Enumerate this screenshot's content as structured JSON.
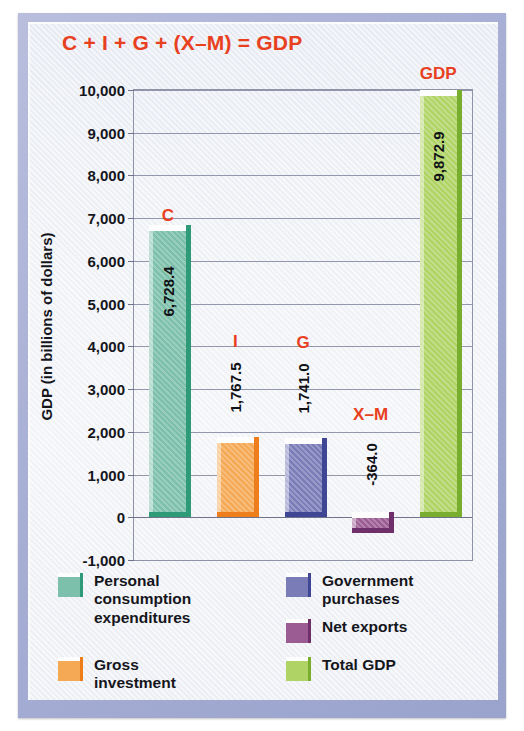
{
  "chart_data": {
    "type": "bar",
    "title": "C + I + G + (X–M) = GDP",
    "xlabel": "",
    "ylabel": "GDP (in billions of dollars)",
    "ylim": [
      -1000,
      10000
    ],
    "ytick_step": 1000,
    "grid": true,
    "legend_position": "below",
    "categories": [
      "Personal consumption expenditures",
      "Gross investment",
      "Government purchases",
      "Net exports",
      "Total GDP"
    ],
    "tags": [
      "C",
      "I",
      "G",
      "X–M",
      "GDP"
    ],
    "values": [
      6728.4,
      1767.5,
      1741.0,
      -364.0,
      9872.9
    ],
    "value_labels": [
      "6,728.4",
      "1,767.5",
      "1,741.0",
      "-364.0",
      "9,872.9"
    ],
    "colors": [
      "#7cc0ab",
      "#f5a955",
      "#7a7cb8",
      "#9a5c93",
      "#afd465"
    ],
    "ytick_labels": [
      "10,000",
      "9,000",
      "8,000",
      "7,000",
      "6,000",
      "5,000",
      "4,000",
      "3,000",
      "2,000",
      "1,000",
      "0",
      "-1,000"
    ],
    "ytick_values": [
      10000,
      9000,
      8000,
      7000,
      6000,
      5000,
      4000,
      3000,
      2000,
      1000,
      0,
      -1000
    ]
  },
  "title": {
    "text": "C + I + G + (X–M) = GDP",
    "color": "#e8401f"
  },
  "axes": {
    "y_title": "GDP (in billions of dollars)"
  },
  "legend": {
    "items": [
      {
        "label": "Personal\nconsumption\nexpenditures",
        "color": "#7cc0ab",
        "side_color": "#2e9a77"
      },
      {
        "label": "Gross\ninvestment",
        "color": "#f5a955",
        "side_color": "#ee7e1c"
      },
      {
        "label": "Government\npurchases",
        "color": "#7a7cb8",
        "side_color": "#3f4795"
      },
      {
        "label": "Net exports",
        "color": "#9a5c93",
        "side_color": "#6e2f6a"
      },
      {
        "label": "Total GDP",
        "color": "#afd465",
        "side_color": "#79ad2e"
      }
    ]
  }
}
